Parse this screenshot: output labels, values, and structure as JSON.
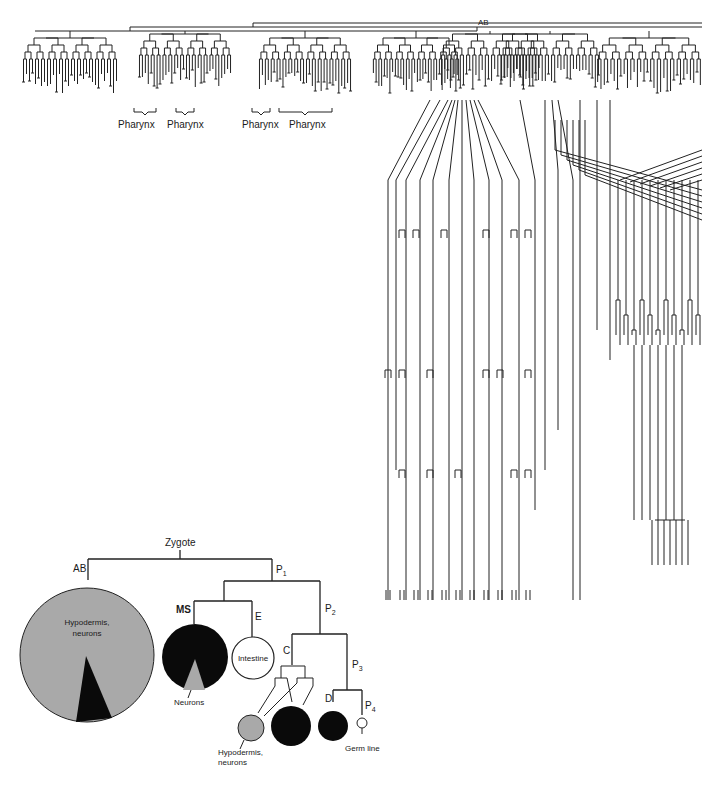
{
  "figure": {
    "domain": "cell lineage diagram",
    "colors": {
      "line": "#222222",
      "gray_fill": "#a9a9a9",
      "black_fill": "#0a0a0a",
      "white_fill": "#ffffff",
      "background": "#ffffff"
    },
    "full_lineage": {
      "root_label": "AB",
      "pharynx_labels": [
        {
          "label": "Pharynx",
          "x": 130
        },
        {
          "label": "Pharynx",
          "x": 182
        },
        {
          "label": "Pharynx",
          "x": 262
        },
        {
          "label": "Pharynx",
          "x": 304
        }
      ]
    },
    "summary_tree": {
      "root": "Zygote",
      "nodes": {
        "AB": "AB",
        "P1": "P",
        "P1_sub": "1",
        "P2": "P",
        "P2_sub": "2",
        "P3": "P",
        "P3_sub": "3",
        "P4": "P",
        "P4_sub": "4",
        "MS": "MS",
        "E": "E",
        "C": "C",
        "D": "D"
      },
      "fate_circles": [
        {
          "id": "ab",
          "label_line1": "Hypodermis,",
          "label_line2": "neurons",
          "fill": "gray",
          "wedge": "black"
        },
        {
          "id": "ms",
          "callout": "Neurons",
          "fill": "black",
          "wedge": "gray"
        },
        {
          "id": "e",
          "label": "Intestine",
          "fill": "white"
        },
        {
          "id": "c-small",
          "callout_line1": "Hypodermis,",
          "callout_line2": "neurons",
          "fill": "gray"
        },
        {
          "id": "c-large",
          "fill": "black"
        },
        {
          "id": "d",
          "fill": "black"
        },
        {
          "id": "p4",
          "callout": "Germ line",
          "fill": "white"
        }
      ]
    }
  }
}
